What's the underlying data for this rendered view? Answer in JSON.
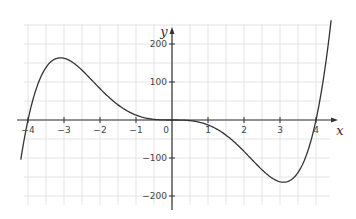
{
  "chart_data": {
    "type": "line",
    "title": "",
    "xlabel": "x",
    "ylabel": "y",
    "xlim": [
      -4.2,
      4.5
    ],
    "ylim": [
      -220,
      260
    ],
    "grid": true,
    "x_ticks": [
      -4,
      -3,
      -2,
      -1,
      0,
      1,
      2,
      3,
      4
    ],
    "x_tick_labels": [
      "-4",
      "-3",
      "-2",
      "-1",
      "0",
      "1",
      "2",
      "3",
      "4"
    ],
    "y_ticks": [
      -200,
      -100,
      100,
      200
    ],
    "y_tick_labels": [
      "-200",
      "-100",
      "100",
      "200"
    ],
    "series": [
      {
        "name": "f(x)",
        "description": "Quintic curve with roots at -4, 0 (flat inflection), 4; local max ~160 at x=-3; local min ~-165 at x=3",
        "x": [
          -4.2,
          -4.0,
          -3.5,
          -3.0,
          -2.5,
          -2.0,
          -1.5,
          -1.0,
          -0.5,
          0,
          0.5,
          1.0,
          1.5,
          2.0,
          2.5,
          3.0,
          3.5,
          4.0,
          4.2,
          4.4
        ],
        "values": [
          -148,
          0,
          138,
          163,
          132,
          83,
          38,
          13,
          1.7,
          0,
          -1.7,
          -13,
          -38,
          -83,
          -132,
          -163,
          -138,
          0,
          148,
          237
        ],
        "color": "#333333"
      }
    ],
    "annotations": [],
    "legend": null
  },
  "plot": {
    "origin_px": [
      172,
      120
    ],
    "px_per_x_unit": 36,
    "px_per_y_unit": 0.38,
    "grid_color": "#e4e4e4",
    "axis_color": "#333333",
    "curve_color": "#333333"
  },
  "labels": {
    "x_axis": "x",
    "y_axis": "y",
    "origin": "0"
  }
}
